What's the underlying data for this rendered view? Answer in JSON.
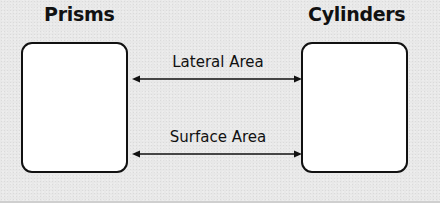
{
  "diagram": {
    "left_node": {
      "title": "Prisms"
    },
    "right_node": {
      "title": "Cylinders"
    },
    "connections": [
      {
        "label": "Lateral Area",
        "direction": "bidirectional"
      },
      {
        "label": "Surface Area",
        "direction": "bidirectional"
      }
    ],
    "colors": {
      "background": "#e8e8e8",
      "box_fill": "#ffffff",
      "stroke": "#111111"
    }
  }
}
